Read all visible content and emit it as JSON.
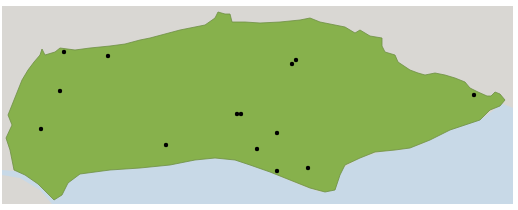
{
  "map": {
    "colors": {
      "background": "#ffffff",
      "neighbor_land": "#d9d7d3",
      "sea": "#c8d9e7",
      "region": "#87b14c",
      "region_border": "#6f8f45",
      "point": "#000000"
    },
    "region": "green-region",
    "points": [
      {
        "x": 64,
        "y": 52
      },
      {
        "x": 108,
        "y": 56
      },
      {
        "x": 60,
        "y": 91
      },
      {
        "x": 41,
        "y": 129
      },
      {
        "x": 166,
        "y": 145
      },
      {
        "x": 237,
        "y": 114
      },
      {
        "x": 241,
        "y": 114
      },
      {
        "x": 277,
        "y": 133
      },
      {
        "x": 257,
        "y": 149
      },
      {
        "x": 277,
        "y": 171
      },
      {
        "x": 308,
        "y": 168
      },
      {
        "x": 292,
        "y": 64
      },
      {
        "x": 296,
        "y": 60
      },
      {
        "x": 474,
        "y": 95
      }
    ]
  }
}
